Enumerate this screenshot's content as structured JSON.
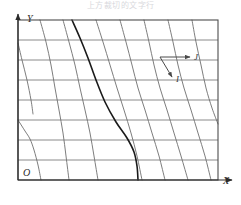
{
  "figure": {
    "top_partial_text": "上方裁切的文字行",
    "origin_label": "O",
    "x_axis_label": "X",
    "y_axis_label": "Y",
    "vectors": [
      {
        "name": "j-vector",
        "label": "J",
        "direction": "right"
      },
      {
        "name": "i-vector",
        "label": "I",
        "direction": "down-right"
      }
    ],
    "colors": {
      "frame": "#4d4d4d",
      "gridline_horizontal": "#8a8a8a",
      "gridline_curved": "#6e6e6e",
      "gridline_bold": "#1a1a1a",
      "axis": "#2b2b2b",
      "background": "#ffffff"
    }
  },
  "chart_data": {
    "type": "line",
    "title": "",
    "subtitle": "",
    "xlabel": "X",
    "ylabel": "Y",
    "xlim": [
      0,
      241
    ],
    "ylim": [
      0,
      205
    ],
    "grid": true,
    "legend": "none",
    "annotations": [
      {
        "text": "J",
        "x": 196,
        "y": 57,
        "style": "italic"
      },
      {
        "text": "I",
        "x": 178,
        "y": 80,
        "style": "italic"
      },
      {
        "text": "O",
        "x": 24,
        "y": 187,
        "style": "italic"
      },
      {
        "text": "X",
        "x": 226,
        "y": 186,
        "style": "italic"
      },
      {
        "text": "Y",
        "x": 30,
        "y": 21,
        "style": "italic"
      }
    ],
    "frame": {
      "x0": 18,
      "y0": 20,
      "x1": 218,
      "y1": 180
    },
    "horizontal_gridlines_y": [
      20,
      40,
      60,
      80,
      100,
      120,
      140,
      160,
      180
    ],
    "series": [
      {
        "name": "curve-1",
        "bold": false,
        "points": [
          [
            18,
            43
          ],
          [
            22,
            60
          ],
          [
            27,
            80
          ],
          [
            31,
            100
          ],
          [
            33,
            114
          ]
        ]
      },
      {
        "name": "curve-2",
        "bold": false,
        "points": [
          [
            18,
            120
          ],
          [
            25,
            131
          ],
          [
            30,
            139
          ],
          [
            34,
            150
          ],
          [
            38,
            165
          ],
          [
            41,
            180
          ]
        ]
      },
      {
        "name": "curve-3",
        "bold": false,
        "points": [
          [
            40,
            20
          ],
          [
            46,
            42
          ],
          [
            51,
            65
          ],
          [
            55,
            88
          ],
          [
            59,
            110
          ],
          [
            63,
            133
          ],
          [
            66,
            156
          ],
          [
            69,
            180
          ]
        ]
      },
      {
        "name": "curve-4",
        "bold": false,
        "points": [
          [
            63,
            20
          ],
          [
            69,
            42
          ],
          [
            75,
            65
          ],
          [
            80,
            88
          ],
          [
            85,
            110
          ],
          [
            90,
            133
          ],
          [
            94,
            156
          ],
          [
            98,
            180
          ]
        ]
      },
      {
        "name": "curve-bold",
        "bold": true,
        "points": [
          [
            72,
            20
          ],
          [
            80,
            38
          ],
          [
            88,
            58
          ],
          [
            96,
            80
          ],
          [
            105,
            102
          ],
          [
            116,
            122
          ],
          [
            127,
            138
          ],
          [
            134,
            152
          ],
          [
            137,
            166
          ],
          [
            138,
            180
          ]
        ]
      },
      {
        "name": "curve-5",
        "bold": false,
        "points": [
          [
            96,
            20
          ],
          [
            103,
            42
          ],
          [
            110,
            65
          ],
          [
            117,
            88
          ],
          [
            124,
            110
          ],
          [
            131,
            133
          ],
          [
            137,
            156
          ],
          [
            142,
            180
          ]
        ]
      },
      {
        "name": "curve-6",
        "bold": false,
        "points": [
          [
            120,
            20
          ],
          [
            126,
            42
          ],
          [
            132,
            65
          ],
          [
            138,
            88
          ],
          [
            145,
            110
          ],
          [
            152,
            133
          ],
          [
            159,
            156
          ],
          [
            165,
            180
          ]
        ]
      },
      {
        "name": "curve-7",
        "bold": false,
        "points": [
          [
            144,
            20
          ],
          [
            149,
            42
          ],
          [
            154,
            65
          ],
          [
            160,
            88
          ],
          [
            167,
            110
          ],
          [
            174,
            133
          ],
          [
            181,
            156
          ],
          [
            188,
            180
          ]
        ]
      },
      {
        "name": "curve-8",
        "bold": false,
        "points": [
          [
            168,
            20
          ],
          [
            173,
            42
          ],
          [
            178,
            65
          ],
          [
            184,
            88
          ],
          [
            191,
            110
          ],
          [
            198,
            133
          ],
          [
            205,
            156
          ],
          [
            211,
            180
          ]
        ]
      },
      {
        "name": "curve-9",
        "bold": false,
        "points": [
          [
            192,
            20
          ],
          [
            196,
            42
          ],
          [
            201,
            65
          ],
          [
            206,
            88
          ],
          [
            212,
            108
          ],
          [
            218,
            124
          ]
        ]
      }
    ]
  }
}
